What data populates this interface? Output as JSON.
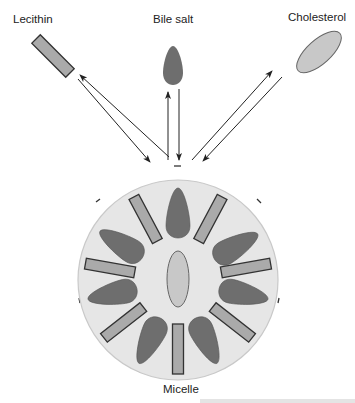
{
  "labels": {
    "lecithin": "Lecithin",
    "bile_salt": "Bile salt",
    "cholesterol": "Cholesterol",
    "micelle": "Micelle"
  },
  "charge_symbol": "–",
  "colors": {
    "micelle_fill": "#e6e6e6",
    "micelle_stroke": "#c8c8c8",
    "bile_salt_fill": "#6e6e6e",
    "lecithin_fill": "#aaaaaa",
    "cholesterol_fill": "#c8c8c8",
    "outline": "#333333",
    "arrow": "#222222"
  },
  "micelle": {
    "components": [
      "bile salt",
      "lecithin",
      "cholesterol"
    ],
    "bile_salt_count": 7,
    "lecithin_count": 7,
    "cholesterol_count": 1
  }
}
